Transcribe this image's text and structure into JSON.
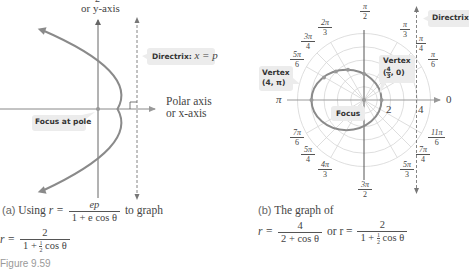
{
  "left_panel": {
    "y_axis_top_label_partial": "2",
    "y_axis_label": "or y-axis",
    "x_axis_label_line1": "Polar axis",
    "x_axis_label_line2": "or x-axis",
    "directrix_label": "Directrix:",
    "directrix_equation": "x = p",
    "focus_label": "Focus at pole",
    "caption": {
      "marker": "(a)",
      "text_before": "Using",
      "r_eq": "r =",
      "numerator": "ep",
      "denominator": "1 + e cos θ",
      "text_after": "to graph",
      "line2_r_eq": "r =",
      "line2_numerator": "2",
      "line2_den_prefix": "1 +",
      "line2_half_num": "1",
      "line2_half_den": "2",
      "line2_den_suffix": "cos θ"
    }
  },
  "right_panel": {
    "angle_labels": [
      {
        "num": "π",
        "den": "2",
        "id": "pi-over-2"
      },
      {
        "num": "2π",
        "den": "3",
        "id": "2pi-over-3"
      },
      {
        "num": "3π",
        "den": "4",
        "id": "3pi-over-4"
      },
      {
        "num": "5π",
        "den": "6",
        "id": "5pi-over-6"
      },
      {
        "num": "π",
        "den": "3",
        "id": "pi-over-3"
      },
      {
        "num": "π",
        "den": "4",
        "id": "pi-over-4"
      },
      {
        "num": "π",
        "den": "6",
        "id": "pi-over-6"
      },
      {
        "num": "7π",
        "den": "6",
        "id": "7pi-over-6"
      },
      {
        "num": "5π",
        "den": "4",
        "id": "5pi-over-4"
      },
      {
        "num": "4π",
        "den": "3",
        "id": "4pi-over-3"
      },
      {
        "num": "3π",
        "den": "2",
        "id": "3pi-over-2"
      },
      {
        "num": "5π",
        "den": "3",
        "id": "5pi-over-3"
      },
      {
        "num": "7π",
        "den": "4",
        "id": "7pi-over-4"
      },
      {
        "num": "11π",
        "den": "6",
        "id": "11pi-over-6"
      }
    ],
    "pi_label": "π",
    "zero_label": "0",
    "radius_labels": [
      "2",
      "4"
    ],
    "directrix_label": "Directrix",
    "vertex_left_label_line1": "Vertex",
    "vertex_left_label_line2": "(4, π)",
    "vertex_right_label_line1": "Vertex",
    "vertex_right_label_open": "(",
    "vertex_right_frac_num": "4",
    "vertex_right_frac_den": "3",
    "vertex_right_label_close": ", 0)",
    "focus_label": "Focus",
    "caption": {
      "marker": "(b)",
      "line1": "The graph of",
      "r_eq": "r =",
      "numerator1": "4",
      "denominator1": "2 + cos θ",
      "or_text": "or r =",
      "numerator2": "2",
      "den2_prefix": "1 +",
      "half_num": "1",
      "half_den": "2",
      "den2_suffix": "cos θ"
    }
  },
  "figure_label": "Figure 9.59",
  "colors": {
    "curve": "#888888",
    "axis": "#555555",
    "grid": "#d4d4d4",
    "callout_bg": "#ececec"
  }
}
